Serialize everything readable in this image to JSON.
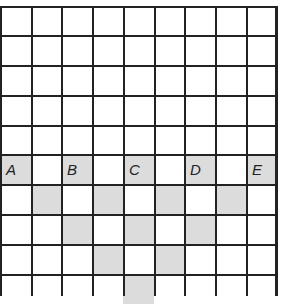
{
  "grid": {
    "columns": 9,
    "rows": 10,
    "shade_color": "#dcdcdc",
    "line_color": "#222222",
    "shaded_cells": [
      [
        5,
        0
      ],
      [
        5,
        2
      ],
      [
        5,
        4
      ],
      [
        5,
        6
      ],
      [
        5,
        8
      ],
      [
        6,
        1
      ],
      [
        6,
        3
      ],
      [
        6,
        5
      ],
      [
        6,
        7
      ],
      [
        7,
        2
      ],
      [
        7,
        4
      ],
      [
        7,
        6
      ],
      [
        8,
        3
      ],
      [
        8,
        5
      ],
      [
        9,
        4
      ]
    ],
    "labels": [
      {
        "text": "A",
        "row": 5,
        "col": 0
      },
      {
        "text": "B",
        "row": 5,
        "col": 2
      },
      {
        "text": "C",
        "row": 5,
        "col": 4
      },
      {
        "text": "D",
        "row": 5,
        "col": 6
      },
      {
        "text": "E",
        "row": 5,
        "col": 8
      }
    ]
  }
}
